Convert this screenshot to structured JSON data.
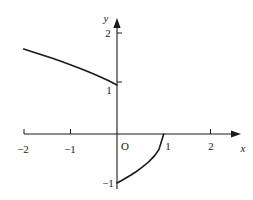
{
  "figure": {
    "background_color": "#ffffff",
    "stroke_color": "#1a1a1a",
    "origin_label": "O"
  },
  "chart_data": {
    "type": "line",
    "title": "",
    "xlabel": "x",
    "ylabel": "y",
    "xlim": [
      -2.3,
      2.6
    ],
    "ylim": [
      -1.25,
      2.25
    ],
    "grid": false,
    "legend": null,
    "x_ticks": [
      -2,
      -1,
      1,
      2
    ],
    "x_tick_labels": [
      "−2",
      "−1",
      "1",
      "2"
    ],
    "y_ticks": [
      1,
      2
    ],
    "y_tick_labels": [
      "1",
      "2"
    ],
    "y_extra_tick_labels": [
      "−1"
    ],
    "axis_arrows": [
      "x-positive",
      "y-positive"
    ],
    "series": [
      {
        "name": "upper-branch",
        "x": [
          -2.0,
          -1.8,
          -1.6,
          -1.4,
          -1.2,
          -1.0,
          -0.8,
          -0.6,
          -0.4,
          -0.2,
          0.0
        ],
        "values": [
          1.732,
          1.673,
          1.612,
          1.549,
          1.483,
          1.414,
          1.342,
          1.265,
          1.183,
          1.095,
          1.0
        ]
      },
      {
        "name": "lower-branch",
        "x": [
          0.0,
          0.1,
          0.2,
          0.3,
          0.4,
          0.5,
          0.6,
          0.7,
          0.8,
          0.9,
          1.0
        ],
        "values": [
          -1.0,
          -0.949,
          -0.894,
          -0.837,
          -0.775,
          -0.707,
          -0.632,
          -0.548,
          -0.447,
          -0.316,
          0.0
        ]
      }
    ]
  }
}
